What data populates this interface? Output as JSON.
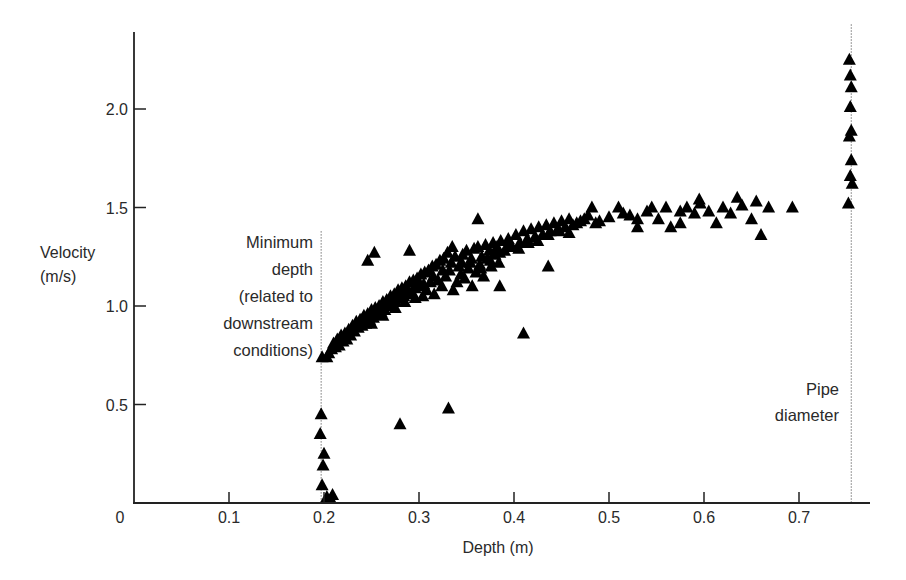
{
  "chart_data": {
    "type": "scatter",
    "title": "",
    "xlabel": "Depth (m)",
    "ylabel": [
      "Velocity",
      "(m/s)"
    ],
    "xlim": [
      0,
      0.78
    ],
    "ylim": [
      0,
      2.4
    ],
    "x_ticks": [
      {
        "value": 0,
        "label": "0"
      },
      {
        "value": 0.1,
        "label": "0.1"
      },
      {
        "value": 0.2,
        "label": "0.2"
      },
      {
        "value": 0.3,
        "label": "0.3"
      },
      {
        "value": 0.4,
        "label": "0.4"
      },
      {
        "value": 0.5,
        "label": "0.5"
      },
      {
        "value": 0.6,
        "label": "0.6"
      },
      {
        "value": 0.7,
        "label": "0.7"
      }
    ],
    "y_ticks": [
      {
        "value": 0.5,
        "label": "0.5"
      },
      {
        "value": 1.0,
        "label": "1.0"
      },
      {
        "value": 1.5,
        "label": "1.5"
      },
      {
        "value": 2.0,
        "label": "2.0"
      }
    ],
    "grid": false,
    "legend": null,
    "marker": "filled-triangle",
    "marker_color": "#000000",
    "reference_lines": [
      {
        "name": "minimum-depth",
        "x": 0.197,
        "y_top": 1.38,
        "style": "dotted",
        "label": [
          "Minimum",
          "depth",
          "(related to",
          "downstream",
          "conditions)"
        ]
      },
      {
        "name": "pipe-diameter",
        "x": 0.755,
        "y_top": 2.43,
        "style": "dotted",
        "label": [
          "Pipe",
          "diameter"
        ]
      }
    ],
    "series": [
      {
        "name": "observations",
        "points": [
          [
            0.197,
            0.45
          ],
          [
            0.196,
            0.35
          ],
          [
            0.2,
            0.25
          ],
          [
            0.199,
            0.19
          ],
          [
            0.198,
            0.09
          ],
          [
            0.203,
            0.03
          ],
          [
            0.207,
            0.02
          ],
          [
            0.209,
            0.04
          ],
          [
            0.198,
            0.74
          ],
          [
            0.203,
            0.74
          ],
          [
            0.205,
            0.76
          ],
          [
            0.208,
            0.78
          ],
          [
            0.21,
            0.81
          ],
          [
            0.212,
            0.79
          ],
          [
            0.214,
            0.83
          ],
          [
            0.216,
            0.8
          ],
          [
            0.218,
            0.85
          ],
          [
            0.22,
            0.82
          ],
          [
            0.222,
            0.86
          ],
          [
            0.224,
            0.83
          ],
          [
            0.226,
            0.88
          ],
          [
            0.228,
            0.85
          ],
          [
            0.23,
            0.9
          ],
          [
            0.232,
            0.87
          ],
          [
            0.234,
            0.92
          ],
          [
            0.236,
            0.89
          ],
          [
            0.238,
            0.93
          ],
          [
            0.24,
            0.9
          ],
          [
            0.242,
            0.95
          ],
          [
            0.244,
            0.91
          ],
          [
            0.246,
            0.96
          ],
          [
            0.248,
            0.93
          ],
          [
            0.25,
            0.98
          ],
          [
            0.252,
            0.94
          ],
          [
            0.254,
            0.99
          ],
          [
            0.256,
            0.96
          ],
          [
            0.258,
            1.0
          ],
          [
            0.26,
            0.97
          ],
          [
            0.262,
            1.02
          ],
          [
            0.264,
            0.98
          ],
          [
            0.266,
            1.03
          ],
          [
            0.268,
            1.0
          ],
          [
            0.27,
            1.05
          ],
          [
            0.272,
            1.01
          ],
          [
            0.274,
            1.06
          ],
          [
            0.276,
            1.02
          ],
          [
            0.278,
            1.08
          ],
          [
            0.28,
            1.04
          ],
          [
            0.282,
            1.09
          ],
          [
            0.284,
            1.05
          ],
          [
            0.286,
            1.1
          ],
          [
            0.288,
            1.06
          ],
          [
            0.29,
            1.12
          ],
          [
            0.292,
            1.07
          ],
          [
            0.294,
            1.13
          ],
          [
            0.296,
            1.09
          ],
          [
            0.298,
            1.14
          ],
          [
            0.3,
            1.1
          ],
          [
            0.302,
            1.16
          ],
          [
            0.304,
            1.05
          ],
          [
            0.306,
            1.17
          ],
          [
            0.308,
            1.08
          ],
          [
            0.31,
            1.18
          ],
          [
            0.312,
            1.12
          ],
          [
            0.314,
            1.2
          ],
          [
            0.316,
            1.06
          ],
          [
            0.318,
            1.21
          ],
          [
            0.32,
            1.13
          ],
          [
            0.322,
            1.23
          ],
          [
            0.324,
            1.1
          ],
          [
            0.326,
            1.24
          ],
          [
            0.328,
            1.15
          ],
          [
            0.33,
            1.27
          ],
          [
            0.332,
            1.18
          ],
          [
            0.334,
            1.22
          ],
          [
            0.336,
            1.08
          ],
          [
            0.338,
            1.25
          ],
          [
            0.34,
            1.12
          ],
          [
            0.342,
            1.2
          ],
          [
            0.344,
            1.16
          ],
          [
            0.346,
            1.26
          ],
          [
            0.348,
            1.14
          ],
          [
            0.35,
            1.28
          ],
          [
            0.352,
            1.19
          ],
          [
            0.354,
            1.22
          ],
          [
            0.356,
            1.1
          ],
          [
            0.358,
            1.29
          ],
          [
            0.36,
            1.17
          ],
          [
            0.362,
            1.3
          ],
          [
            0.364,
            1.21
          ],
          [
            0.366,
            1.25
          ],
          [
            0.368,
            1.15
          ],
          [
            0.37,
            1.31
          ],
          [
            0.372,
            1.24
          ],
          [
            0.374,
            1.28
          ],
          [
            0.376,
            1.2
          ],
          [
            0.378,
            1.32
          ],
          [
            0.38,
            1.26
          ],
          [
            0.382,
            1.3
          ],
          [
            0.384,
            1.22
          ],
          [
            0.386,
            1.33
          ],
          [
            0.39,
            1.28
          ],
          [
            0.394,
            1.34
          ],
          [
            0.398,
            1.3
          ],
          [
            0.402,
            1.36
          ],
          [
            0.406,
            1.32
          ],
          [
            0.41,
            1.38
          ],
          [
            0.414,
            1.34
          ],
          [
            0.418,
            1.39
          ],
          [
            0.422,
            1.35
          ],
          [
            0.426,
            1.4
          ],
          [
            0.43,
            1.36
          ],
          [
            0.434,
            1.41
          ],
          [
            0.438,
            1.38
          ],
          [
            0.442,
            1.42
          ],
          [
            0.446,
            1.39
          ],
          [
            0.45,
            1.43
          ],
          [
            0.454,
            1.4
          ],
          [
            0.458,
            1.44
          ],
          [
            0.462,
            1.41
          ],
          [
            0.466,
            1.42
          ],
          [
            0.47,
            1.43
          ],
          [
            0.474,
            1.44
          ],
          [
            0.478,
            1.46
          ],
          [
            0.482,
            1.5
          ],
          [
            0.486,
            1.42
          ],
          [
            0.49,
            1.43
          ],
          [
            0.24,
            0.93
          ],
          [
            0.25,
            0.91
          ],
          [
            0.262,
            0.95
          ],
          [
            0.275,
            0.99
          ],
          [
            0.285,
            1.02
          ],
          [
            0.296,
            1.04
          ],
          [
            0.305,
            1.11
          ],
          [
            0.315,
            1.15
          ],
          [
            0.325,
            1.18
          ],
          [
            0.335,
            1.3
          ],
          [
            0.345,
            1.22
          ],
          [
            0.355,
            1.24
          ],
          [
            0.365,
            1.19
          ],
          [
            0.375,
            1.23
          ],
          [
            0.385,
            1.27
          ],
          [
            0.395,
            1.31
          ],
          [
            0.405,
            1.29
          ],
          [
            0.415,
            1.32
          ],
          [
            0.425,
            1.33
          ],
          [
            0.436,
            1.36
          ],
          [
            0.448,
            1.38
          ],
          [
            0.458,
            1.37
          ],
          [
            0.5,
            1.45
          ],
          [
            0.51,
            1.5
          ],
          [
            0.515,
            1.47
          ],
          [
            0.522,
            1.46
          ],
          [
            0.53,
            1.44
          ],
          [
            0.54,
            1.48
          ],
          [
            0.545,
            1.5
          ],
          [
            0.552,
            1.44
          ],
          [
            0.56,
            1.5
          ],
          [
            0.565,
            1.4
          ],
          [
            0.575,
            1.48
          ],
          [
            0.582,
            1.5
          ],
          [
            0.59,
            1.47
          ],
          [
            0.595,
            1.54
          ],
          [
            0.605,
            1.48
          ],
          [
            0.613,
            1.42
          ],
          [
            0.62,
            1.5
          ],
          [
            0.628,
            1.47
          ],
          [
            0.635,
            1.55
          ],
          [
            0.64,
            1.51
          ],
          [
            0.65,
            1.44
          ],
          [
            0.655,
            1.53
          ],
          [
            0.66,
            1.36
          ],
          [
            0.668,
            1.5
          ],
          [
            0.693,
            1.5
          ],
          [
            0.596,
            1.52
          ],
          [
            0.575,
            1.42
          ],
          [
            0.53,
            1.4
          ],
          [
            0.253,
            1.27
          ],
          [
            0.246,
            1.23
          ],
          [
            0.29,
            1.28
          ],
          [
            0.362,
            1.44
          ],
          [
            0.436,
            1.2
          ],
          [
            0.385,
            1.1
          ],
          [
            0.41,
            0.86
          ],
          [
            0.28,
            0.4
          ],
          [
            0.331,
            0.48
          ],
          [
            0.753,
            2.25
          ],
          [
            0.754,
            2.17
          ],
          [
            0.755,
            2.11
          ],
          [
            0.754,
            2.01
          ],
          [
            0.755,
            1.89
          ],
          [
            0.753,
            1.86
          ],
          [
            0.755,
            1.74
          ],
          [
            0.754,
            1.66
          ],
          [
            0.756,
            1.62
          ],
          [
            0.752,
            1.52
          ]
        ]
      }
    ]
  },
  "labels": {
    "y_title_line1": "Velocity",
    "y_title_line2": "(m/s)",
    "x_title": "Depth (m)",
    "min_depth": [
      "Minimum",
      "depth",
      "(related to",
      "downstream",
      "conditions)"
    ],
    "pipe": [
      "Pipe",
      "diameter"
    ]
  }
}
